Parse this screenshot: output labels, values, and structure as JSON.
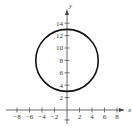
{
  "chart_data": {
    "type": "line",
    "title": "",
    "xlabel": "x",
    "ylabel": "y",
    "xlim": [
      -9,
      10
    ],
    "ylim": [
      -2,
      16
    ],
    "grid": false,
    "x_ticks": [
      -8,
      -6,
      -4,
      -2,
      2,
      4,
      6,
      8
    ],
    "y_ticks": [
      2,
      4,
      6,
      8,
      10,
      12,
      14
    ],
    "x_tick_labels": [
      "−8",
      "−6",
      "−4",
      "−2",
      "2",
      "4",
      "6",
      "8"
    ],
    "y_tick_labels": [
      "2",
      "4",
      "6",
      "8",
      "10",
      "12",
      "14"
    ],
    "series": [
      {
        "name": "circle",
        "shape": "circle",
        "center": [
          0,
          8
        ],
        "radius": 5,
        "equation": "x^2 + (y - 8)^2 = 25",
        "color": "#111111"
      }
    ]
  },
  "labels": {
    "x_axis": "x",
    "y_axis": "y"
  },
  "colors": {
    "axes": "#444444",
    "curve": "#111111",
    "background": "#ffffff"
  }
}
